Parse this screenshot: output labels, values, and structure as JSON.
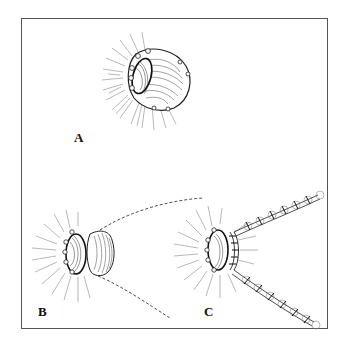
{
  "figure": {
    "panels": [
      {
        "id": "A",
        "label": "A",
        "description": "stoma / everted opening with radial hatching"
      },
      {
        "id": "B",
        "label": "B",
        "description": "opening with attached tube segment and dashed guide lines"
      },
      {
        "id": "C",
        "label": "C",
        "description": "opening with two sutured strips extending outward"
      }
    ],
    "colors": {
      "ink": "#111111",
      "hatch": "#777777",
      "border": "#555555",
      "background": "#ffffff"
    }
  }
}
